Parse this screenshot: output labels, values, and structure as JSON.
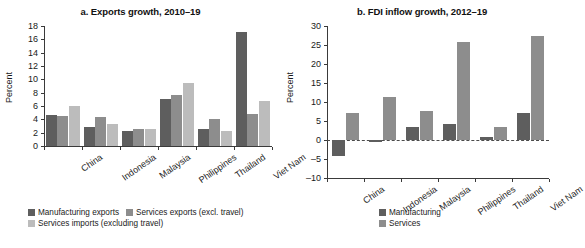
{
  "figure": {
    "panels": [
      {
        "key": "exports",
        "title": "a. Exports growth, 2010–19",
        "ylabel": "Percent"
      },
      {
        "key": "fdi",
        "title": "b. FDI inflow growth, 2012–19",
        "ylabel": "Percent"
      }
    ]
  },
  "chart_data": [
    {
      "type": "bar",
      "title": "a. Exports growth, 2010–19",
      "xlabel": "",
      "ylabel": "Percent",
      "ylim": [
        0,
        18
      ],
      "yticks": [
        0,
        2,
        4,
        6,
        8,
        10,
        12,
        14,
        16,
        18
      ],
      "grid": false,
      "legend_position": "bottom-left",
      "categories": [
        "China",
        "Indonesia",
        "Malaysia",
        "Philippines",
        "Thailand",
        "Viet Nam"
      ],
      "series": [
        {
          "name": "Manufacturing exports",
          "color": "#5e5e5e",
          "values": [
            4.6,
            2.9,
            2.3,
            7.0,
            2.6,
            17.1
          ]
        },
        {
          "name": "Services exports (excl. travel)",
          "color": "#8d8d8d",
          "values": [
            4.5,
            4.3,
            2.5,
            7.6,
            4.1,
            4.8
          ]
        },
        {
          "name": "Services imports (excluding travel)",
          "color": "#bcbcbc",
          "values": [
            6.0,
            3.3,
            2.55,
            9.4,
            2.2,
            6.7
          ]
        }
      ]
    },
    {
      "type": "bar",
      "title": "b. FDI inflow growth, 2012–19",
      "xlabel": "",
      "ylabel": "Percent",
      "ylim": [
        -10,
        30
      ],
      "yticks": [
        -10,
        -5,
        0,
        5,
        10,
        15,
        20,
        25,
        30
      ],
      "grid": false,
      "zero_line": true,
      "legend_position": "bottom-left",
      "categories": [
        "China",
        "Indonesia",
        "Malaysia",
        "Philippines",
        "Thailand",
        "Viet Nam"
      ],
      "series": [
        {
          "name": "Manufacturing",
          "color": "#5e5e5e",
          "values": [
            -4.3,
            -0.4,
            3.5,
            4.2,
            0.8,
            7.1
          ]
        },
        {
          "name": "Services",
          "color": "#8d8d8d",
          "values": [
            7.1,
            11.4,
            7.6,
            25.7,
            3.3,
            27.5
          ]
        }
      ]
    }
  ],
  "panel_a": {
    "title": "a. Exports growth, 2010–19",
    "ylabel": "Percent",
    "yticks": [
      "18",
      "16",
      "14",
      "12",
      "10",
      "8",
      "6",
      "4",
      "2",
      "0"
    ],
    "categories": [
      "China",
      "Indonesia",
      "Malaysia",
      "Philippines",
      "Thailand",
      "Viet Nam"
    ],
    "legend": [
      "Manufacturing exports",
      "Services exports (excl. travel)",
      "Services imports (excluding travel)"
    ]
  },
  "panel_b": {
    "title": "b. FDI inflow growth, 2012–19",
    "ylabel": "Percent",
    "yticks": [
      "30",
      "25",
      "20",
      "15",
      "10",
      "5",
      "0",
      "–5",
      "–10"
    ],
    "categories": [
      "China",
      "Indonesia",
      "Malaysia",
      "Philippines",
      "Thailand",
      "Viet Nam"
    ],
    "legend": [
      "Manufacturing",
      "Services"
    ]
  }
}
